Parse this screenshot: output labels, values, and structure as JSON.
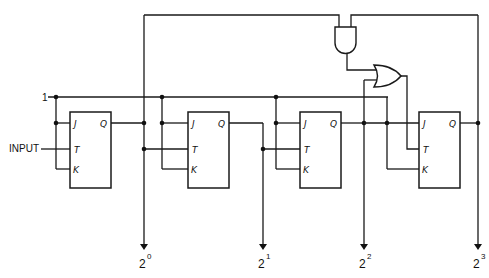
{
  "diagram": {
    "type": "4-bit binary counter with JK flip-flops",
    "labels": {
      "logic_one": "1",
      "input": "INPUT"
    },
    "flip_flops": [
      {
        "id": "ff0",
        "pins": {
          "j": "J",
          "t": "T",
          "k": "K",
          "q": "Q"
        }
      },
      {
        "id": "ff1",
        "pins": {
          "j": "J",
          "t": "T",
          "k": "K",
          "q": "Q"
        }
      },
      {
        "id": "ff2",
        "pins": {
          "j": "J",
          "t": "T",
          "k": "K",
          "q": "Q"
        }
      },
      {
        "id": "ff3",
        "pins": {
          "j": "J",
          "t": "T",
          "k": "K",
          "q": "Q"
        }
      }
    ],
    "gates": [
      {
        "id": "and-gate",
        "kind": "AND"
      },
      {
        "id": "or-gate",
        "kind": "OR"
      }
    ],
    "outputs": [
      {
        "base": "2",
        "exp": "0"
      },
      {
        "base": "2",
        "exp": "1"
      },
      {
        "base": "2",
        "exp": "2"
      },
      {
        "base": "2",
        "exp": "3"
      }
    ]
  }
}
